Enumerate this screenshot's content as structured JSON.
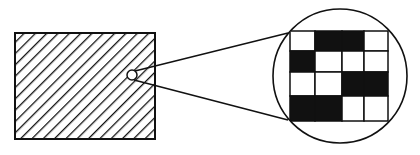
{
  "diagram": {
    "colors": {
      "ink": "#111111",
      "paper": "#ffffff"
    },
    "rectangle": {
      "x": 15,
      "y": 33,
      "width": 140,
      "height": 106,
      "fill": "diagonal-hatch"
    },
    "magnifier_source": {
      "cx": 132,
      "cy": 75,
      "r": 5
    },
    "magnifier_lens": {
      "cx": 340,
      "cy": 76,
      "r": 67
    },
    "grid": {
      "rows": 4,
      "cols": 4,
      "cells": [
        [
          "white",
          "black",
          "black",
          "white"
        ],
        [
          "black",
          "white",
          "white",
          "white"
        ],
        [
          "white",
          "white",
          "black",
          "black"
        ],
        [
          "black",
          "black",
          "white",
          "white"
        ]
      ]
    }
  }
}
